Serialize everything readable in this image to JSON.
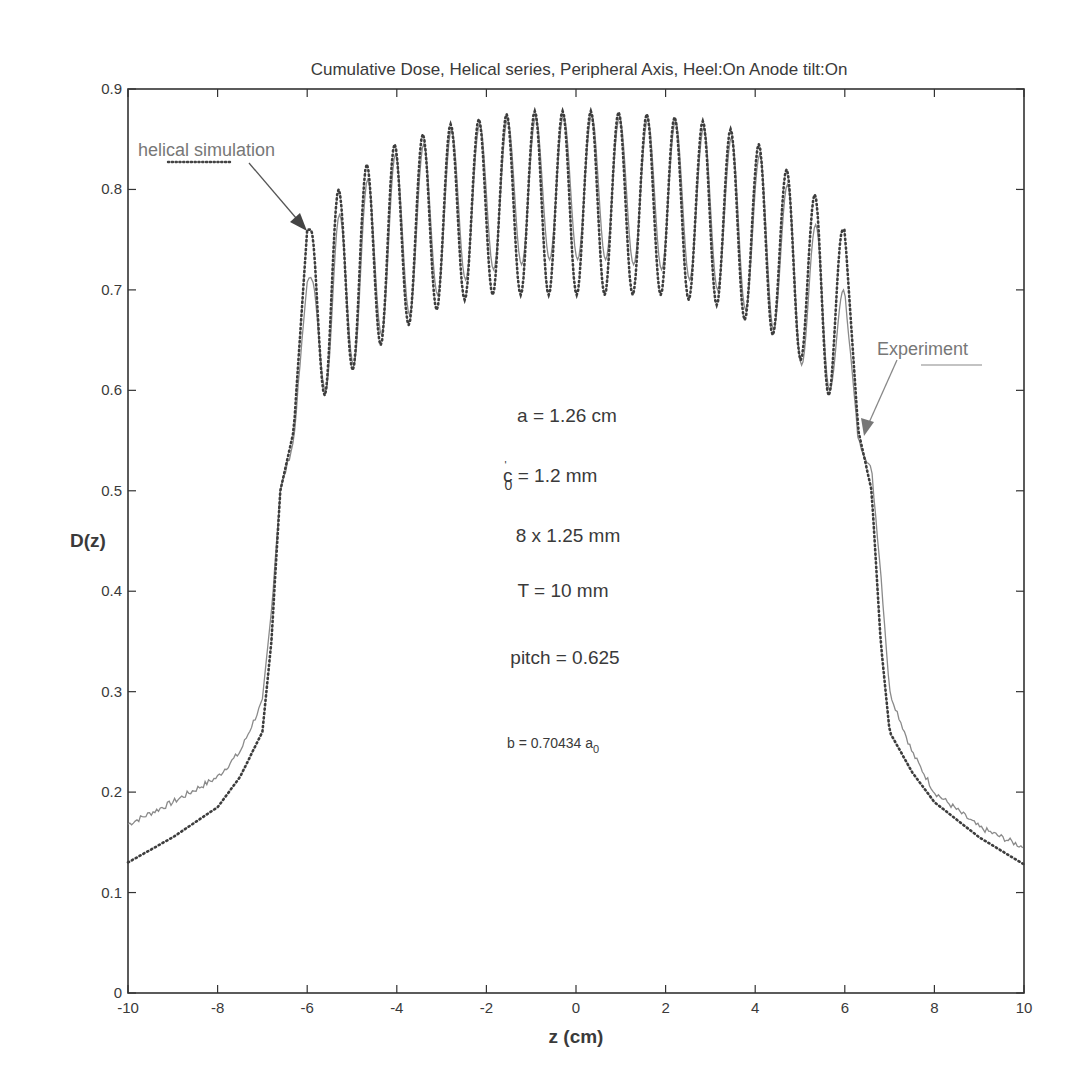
{
  "chart_data": {
    "type": "line",
    "title": "Cumulative Dose, Helical series, Peripheral Axis, Heel:On  Anode tilt:On",
    "xlabel": "z (cm)",
    "ylabel": "D(z)",
    "xlim": [
      -10,
      10
    ],
    "ylim": [
      0,
      0.9
    ],
    "xticks": [
      -10,
      -8,
      -6,
      -4,
      -2,
      0,
      2,
      4,
      6,
      8,
      10
    ],
    "yticks": [
      0,
      0.1,
      0.2,
      0.3,
      0.4,
      0.5,
      0.6,
      0.7,
      0.8,
      0.9
    ],
    "xtick_labels": [
      "-10",
      "-8",
      "-6",
      "-4",
      "-2",
      "0",
      "2",
      "4",
      "6",
      "8",
      "10"
    ],
    "ytick_labels": [
      "0",
      "0.1",
      "0.2",
      "0.3",
      "0.4",
      "0.5",
      "0.6",
      "0.7",
      "0.8",
      "0.9"
    ],
    "grid": false,
    "series": [
      {
        "name": "helical simulation",
        "style": "dotted",
        "color": "#444444",
        "peak_z": [
          -5.92,
          -5.3,
          -4.67,
          -4.05,
          -3.42,
          -2.8,
          -2.17,
          -1.55,
          -0.92,
          -0.3,
          0.33,
          0.95,
          1.58,
          2.2,
          2.83,
          3.45,
          4.08,
          4.7,
          5.33,
          5.95
        ],
        "peak_values": [
          0.76,
          0.8,
          0.825,
          0.845,
          0.855,
          0.865,
          0.87,
          0.875,
          0.878,
          0.878,
          0.878,
          0.877,
          0.875,
          0.872,
          0.868,
          0.86,
          0.845,
          0.82,
          0.795,
          0.76
        ],
        "trough_values": [
          0.595,
          0.62,
          0.645,
          0.665,
          0.68,
          0.69,
          0.695,
          0.695,
          0.695,
          0.695,
          0.695,
          0.695,
          0.695,
          0.69,
          0.685,
          0.67,
          0.655,
          0.63,
          0.595
        ],
        "x": [
          -10,
          -9,
          -8,
          -7.5,
          -7,
          -6.8,
          -6.6,
          -6.3,
          -6.0,
          0,
          6.0,
          6.3,
          6.6,
          6.8,
          7,
          7.5,
          8,
          9,
          10
        ],
        "y": [
          0.13,
          0.155,
          0.185,
          0.215,
          0.26,
          0.35,
          0.5,
          0.56,
          0.76,
          0.878,
          0.76,
          0.56,
          0.5,
          0.35,
          0.26,
          0.22,
          0.19,
          0.155,
          0.128
        ]
      },
      {
        "name": "Experiment",
        "style": "solid",
        "color": "#888888",
        "peak_z": [
          -5.9,
          -5.28,
          -4.65,
          -4.03,
          -3.4,
          -2.78,
          -2.15,
          -1.53,
          -0.9,
          -0.28,
          0.35,
          0.97,
          1.6,
          2.22,
          2.85,
          3.47,
          4.1,
          4.72,
          5.35,
          5.97
        ],
        "peak_values": [
          0.71,
          0.775,
          0.81,
          0.835,
          0.845,
          0.86,
          0.865,
          0.87,
          0.872,
          0.874,
          0.874,
          0.872,
          0.87,
          0.868,
          0.862,
          0.852,
          0.835,
          0.805,
          0.765,
          0.7
        ],
        "trough_values": [
          0.6,
          0.625,
          0.655,
          0.675,
          0.695,
          0.71,
          0.72,
          0.725,
          0.73,
          0.73,
          0.73,
          0.725,
          0.72,
          0.71,
          0.7,
          0.68,
          0.66,
          0.625,
          0.6
        ],
        "x": [
          -10,
          -9,
          -8,
          -7.5,
          -7,
          -6.8,
          -6.6,
          -6.3,
          -6.0,
          0,
          6.0,
          6.3,
          6.6,
          6.8,
          7,
          7.5,
          8,
          9,
          10
        ],
        "y": [
          0.168,
          0.19,
          0.215,
          0.24,
          0.29,
          0.38,
          0.5,
          0.55,
          0.71,
          0.874,
          0.7,
          0.55,
          0.52,
          0.42,
          0.3,
          0.24,
          0.2,
          0.165,
          0.145
        ]
      }
    ],
    "annotations": [
      {
        "text": "helical simulation",
        "kind": "legend-label",
        "arrow_to": [
          -5.9,
          0.76
        ]
      },
      {
        "text": "Experiment",
        "kind": "legend-label",
        "arrow_to": [
          6.45,
          0.55
        ]
      },
      {
        "text": "a = 1.26  cm"
      },
      {
        "text_main": "c",
        "sup": "'",
        "sub": "0",
        "text_rest": " = 1.2  mm"
      },
      {
        "text": "8 x 1.25 mm"
      },
      {
        "text": "T = 10 mm"
      },
      {
        "text": "pitch = 0.625"
      },
      {
        "text_main": "b = 0.70434 a",
        "sub": "0"
      }
    ]
  }
}
